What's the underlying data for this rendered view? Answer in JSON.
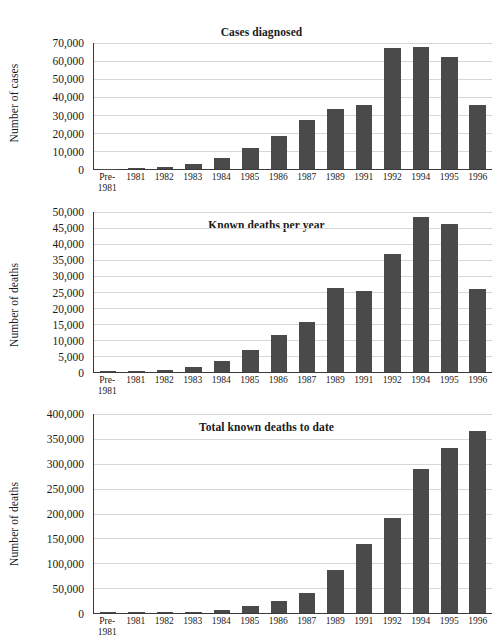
{
  "chart_data": [
    {
      "type": "bar",
      "title": "Cases diagnosed",
      "xlabel": "",
      "ylabel": "Number of cases",
      "categories": [
        "Pre-1981",
        "1981",
        "1982",
        "1983",
        "1984",
        "1985",
        "1986",
        "1987",
        "1989",
        "1991",
        "1992",
        "1994",
        "1995",
        "1996"
      ],
      "values": [
        100,
        350,
        1200,
        3000,
        6000,
        11500,
        18500,
        27500,
        33500,
        35500,
        67000,
        68000,
        62000,
        35500
      ],
      "ylim": [
        0,
        70000
      ],
      "yticks": [
        0,
        10000,
        20000,
        30000,
        40000,
        50000,
        60000,
        70000
      ],
      "ytick_labels": [
        "0",
        "10,000",
        "20,000",
        "30,000",
        "40,000",
        "50,000",
        "60,000",
        "70,000"
      ],
      "grid": true,
      "legend": "none",
      "bar_color": "#4a4a4a"
    },
    {
      "type": "bar",
      "title": "Known deaths per year",
      "xlabel": "",
      "ylabel": "Number of deaths",
      "categories": [
        "Pre-1981",
        "1981",
        "1982",
        "1983",
        "1984",
        "1985",
        "1986",
        "1987",
        "1989",
        "1991",
        "1992",
        "1994",
        "1995",
        "1996"
      ],
      "values": [
        50,
        250,
        600,
        1600,
        3500,
        6800,
        11700,
        15600,
        26100,
        25200,
        36900,
        48400,
        46100,
        26000
      ],
      "ylim": [
        0,
        50000
      ],
      "yticks": [
        0,
        5000,
        10000,
        15000,
        20000,
        25000,
        30000,
        35000,
        40000,
        45000,
        50000
      ],
      "ytick_labels": [
        "0",
        "5,000",
        "10,000",
        "15,000",
        "20,000",
        "25,000",
        "30,000",
        "35,000",
        "40,000",
        "45,000",
        "50,000"
      ],
      "grid": true,
      "legend": "none",
      "bar_color": "#4a4a4a"
    },
    {
      "type": "bar",
      "title": "Total known deaths to date",
      "xlabel": "",
      "ylabel": "Number of deaths",
      "categories": [
        "Pre-1981",
        "1981",
        "1982",
        "1983",
        "1984",
        "1985",
        "1986",
        "1987",
        "1989",
        "1991",
        "1992",
        "1994",
        "1995",
        "1996"
      ],
      "values": [
        100,
        400,
        1200,
        3000,
        6500,
        13500,
        25000,
        40500,
        86000,
        138000,
        191000,
        290000,
        331000,
        365000
      ],
      "ylim": [
        0,
        400000
      ],
      "yticks": [
        0,
        50000,
        100000,
        150000,
        200000,
        250000,
        300000,
        350000,
        400000
      ],
      "ytick_labels": [
        "0",
        "50,000",
        "100,000",
        "150,000",
        "200,000",
        "250,000",
        "300,000",
        "350,000",
        "400,000"
      ],
      "grid": true,
      "legend": "none",
      "bar_color": "#4a4a4a"
    }
  ]
}
